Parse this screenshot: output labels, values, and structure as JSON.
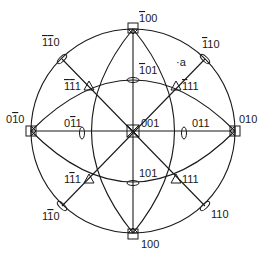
{
  "diagram": {
    "type": "stereographic-projection",
    "title": "",
    "center": [
      133,
      131
    ],
    "radius": 102,
    "stroke_color": "#1a1a1a",
    "poles": [
      {
        "id": "001",
        "label": "001",
        "symbol": "square4",
        "x": 133,
        "y": 131,
        "lx": 141,
        "ly": 126
      },
      {
        "id": "-100",
        "label": "̅100",
        "symbol": "square",
        "x": 133,
        "y": 29,
        "lx": 141,
        "ly": 22
      },
      {
        "id": "100",
        "label": "100",
        "symbol": "square",
        "x": 133,
        "y": 233,
        "lx": 141,
        "ly": 248
      },
      {
        "id": "0-10",
        "label": "0̅1​0",
        "symbol": "square",
        "x": 31,
        "y": 131,
        "lx": 8,
        "ly": 123
      },
      {
        "id": "010",
        "label": "010",
        "symbol": "square",
        "x": 235,
        "y": 131,
        "lx": 239,
        "ly": 123
      },
      {
        "id": "-101",
        "label": "̅101",
        "symbol": "ellipse-h",
        "x": 133,
        "y": 80,
        "lx": 139,
        "ly": 73
      },
      {
        "id": "101",
        "label": "101",
        "symbol": "ellipse-h",
        "x": 133,
        "y": 183,
        "lx": 139,
        "ly": 177
      },
      {
        "id": "0-11",
        "label": "0̅1​1",
        "symbol": "ellipse-v",
        "x": 82,
        "y": 133,
        "lx": 66,
        "ly": 126
      },
      {
        "id": "011",
        "label": "011",
        "symbol": "ellipse-v",
        "x": 184,
        "y": 133,
        "lx": 192,
        "ly": 126
      },
      {
        "id": "-1-11",
        "label": "̅1̅​11",
        "symbol": "triangle",
        "x": 89,
        "y": 86,
        "lx": 65,
        "ly": 89
      },
      {
        "id": "-111",
        "label": "̅111",
        "symbol": "triangle",
        "x": 176,
        "y": 86,
        "lx": 182,
        "ly": 89
      },
      {
        "id": "1-11",
        "label": "1̅1​1",
        "symbol": "triangle",
        "x": 89,
        "y": 179,
        "lx": 65,
        "ly": 182
      },
      {
        "id": "111",
        "label": "111",
        "symbol": "triangle",
        "x": 176,
        "y": 179,
        "lx": 182,
        "ly": 182
      },
      {
        "id": "-1-10",
        "label": "̅1̅1​0",
        "symbol": "ellipse-d1",
        "x": 62,
        "y": 59,
        "lx": 43,
        "ly": 45
      },
      {
        "id": "-110",
        "label": "̅110",
        "symbol": "ellipse-d2",
        "x": 205,
        "y": 59,
        "lx": 202,
        "ly": 47
      },
      {
        "id": "1-10",
        "label": "1̅1​0",
        "symbol": "ellipse-d2",
        "x": 62,
        "y": 206,
        "lx": 43,
        "ly": 219
      },
      {
        "id": "110",
        "label": "110",
        "symbol": "ellipse-d1",
        "x": 205,
        "y": 206,
        "lx": 211,
        "ly": 217
      }
    ],
    "annotation": {
      "label": "·a",
      "x": 175,
      "y": 65
    },
    "text_labels": {
      "l001": "001",
      "l_100": "100",
      "l100": "100",
      "l0_10": "010",
      "l010": "010",
      "l_101": "101",
      "l101": "101",
      "l0_11": "011",
      "l011": "011",
      "l_1_11": "111",
      "l_111": "111",
      "l1_11": "111",
      "l111": "111",
      "l_1_10": "110",
      "l_110": "110",
      "l1_10": "110",
      "l110": "110",
      "la": "·a"
    }
  }
}
